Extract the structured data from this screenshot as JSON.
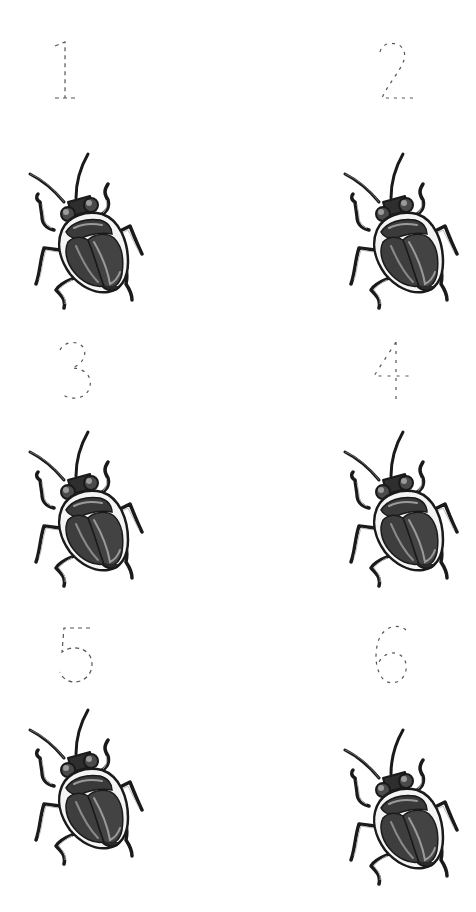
{
  "worksheet": {
    "title": "Count the beetles",
    "background": "#ffffff",
    "trace_color": "#555555",
    "beetle_colors": {
      "body": "#3e3e3e",
      "shell_highlight": "#9a9a9a",
      "outline": "#1a1a1a",
      "rim": "#f2f2f2"
    },
    "items": [
      {
        "number": "1",
        "icon": "beetle-icon",
        "count": 1
      },
      {
        "number": "2",
        "icon": "beetle-icon",
        "count": 1
      },
      {
        "number": "3",
        "icon": "beetle-icon",
        "count": 1
      },
      {
        "number": "4",
        "icon": "beetle-icon",
        "count": 1
      },
      {
        "number": "5",
        "icon": "beetle-icon",
        "count": 1
      },
      {
        "number": "6",
        "icon": "beetle-icon",
        "count": 1
      }
    ]
  }
}
